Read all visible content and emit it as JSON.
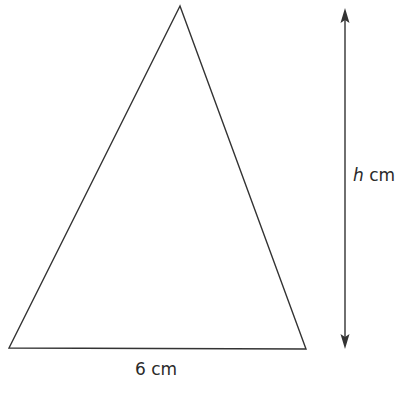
{
  "diagram": {
    "shape": "triangle",
    "base_label": "6 cm",
    "height_label": {
      "variable": "h",
      "unit": "cm"
    },
    "colors": {
      "stroke": "#333333",
      "background": "#ffffff"
    }
  }
}
